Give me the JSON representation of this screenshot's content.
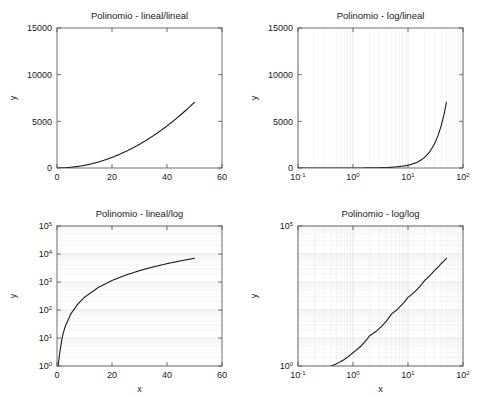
{
  "figure": {
    "background_color": "#ffffff",
    "layout": "2x2 subplot grid",
    "axis_color": "#4d4d4d",
    "curve_color": "#1a1a1a",
    "grid_major_color": "#cccccc",
    "grid_minor_color": "#e0e0e0"
  },
  "chart_data": [
    {
      "id": "lineal-lineal",
      "position": "top-left",
      "type": "line",
      "title": "Polinomio - lineal/lineal",
      "xlabel": "",
      "ylabel": "y",
      "xscale": "linear",
      "yscale": "linear",
      "xlim": [
        0,
        60
      ],
      "ylim": [
        0,
        15000
      ],
      "xticks": [
        0,
        20,
        40,
        60
      ],
      "xticklabels": [
        "0",
        "20",
        "40",
        "60"
      ],
      "yticks": [
        0,
        5000,
        10000,
        15000
      ],
      "yticklabels": [
        "0",
        "5000",
        "10000",
        "15000"
      ],
      "grid": false,
      "x": [
        0,
        2.5,
        5,
        7.5,
        10,
        12.5,
        15,
        17.5,
        20,
        22.5,
        25,
        27.5,
        30,
        32.5,
        35,
        37.5,
        40,
        42.5,
        45,
        47.5,
        50
      ],
      "y": [
        0,
        19,
        72,
        160,
        285,
        444,
        638,
        868,
        1132,
        1431,
        1766,
        2135,
        2540,
        2979,
        3454,
        3964,
        4508,
        5088,
        5703,
        6353,
        7037
      ]
    },
    {
      "id": "log-lineal",
      "position": "top-right",
      "type": "line",
      "title": "Polinomio - log/lineal",
      "xlabel": "",
      "ylabel": "y",
      "xscale": "log",
      "yscale": "linear",
      "xlim": [
        0.1,
        100
      ],
      "ylim": [
        0,
        15000
      ],
      "xticks": [
        0.1,
        1,
        10,
        100
      ],
      "xticklabels": [
        "10⁻¹",
        "10⁰",
        "10¹",
        "10²"
      ],
      "yticks": [
        0,
        5000,
        10000,
        15000
      ],
      "yticklabels": [
        "0",
        "5000",
        "10000",
        "15000"
      ],
      "grid": true,
      "grid_axis": "x",
      "x": [
        0.1,
        1,
        2,
        5,
        10,
        15,
        20,
        25,
        30,
        35,
        40,
        45,
        50
      ],
      "y": [
        0,
        3,
        12,
        72,
        285,
        638,
        1132,
        1766,
        2540,
        3454,
        4508,
        5703,
        7037
      ]
    },
    {
      "id": "lineal-log",
      "position": "bottom-left",
      "type": "line",
      "title": "Polinomio - lineal/log",
      "xlabel": "x",
      "ylabel": "y",
      "xscale": "linear",
      "yscale": "log",
      "xlim": [
        0,
        60
      ],
      "ylim": [
        1,
        100000
      ],
      "xticks": [
        0,
        20,
        40,
        60
      ],
      "xticklabels": [
        "0",
        "20",
        "40",
        "60"
      ],
      "yticks": [
        1,
        10,
        100,
        1000,
        10000,
        100000
      ],
      "yticklabels": [
        "10⁰",
        "10¹",
        "10²",
        "10³",
        "10⁴",
        "10⁵"
      ],
      "grid": true,
      "grid_axis": "y",
      "x": [
        0.4,
        1,
        2,
        3,
        5,
        7.5,
        10,
        15,
        20,
        25,
        30,
        35,
        40,
        45,
        50
      ],
      "y": [
        1,
        3,
        12,
        26,
        72,
        160,
        285,
        638,
        1132,
        1766,
        2540,
        3454,
        4508,
        5703,
        7037
      ]
    },
    {
      "id": "log-log",
      "position": "bottom-right",
      "type": "line",
      "title": "Polinomio - log/log",
      "xlabel": "x",
      "ylabel": "y",
      "xscale": "log",
      "yscale": "log",
      "xlim": [
        0.1,
        100
      ],
      "ylim": [
        1,
        100000
      ],
      "xticks": [
        0.1,
        1,
        10,
        100
      ],
      "xticklabels": [
        "10⁻¹",
        "10⁰",
        "10¹",
        "10²"
      ],
      "yticks": [
        1,
        100000
      ],
      "yticklabels": [
        "10⁰",
        "10⁵"
      ],
      "grid": true,
      "grid_axis": "x",
      "x": [
        0.4,
        1,
        2,
        5,
        10,
        20,
        30,
        40,
        50
      ],
      "y": [
        1,
        3,
        12,
        72,
        285,
        1132,
        2540,
        4508,
        7037
      ]
    }
  ]
}
